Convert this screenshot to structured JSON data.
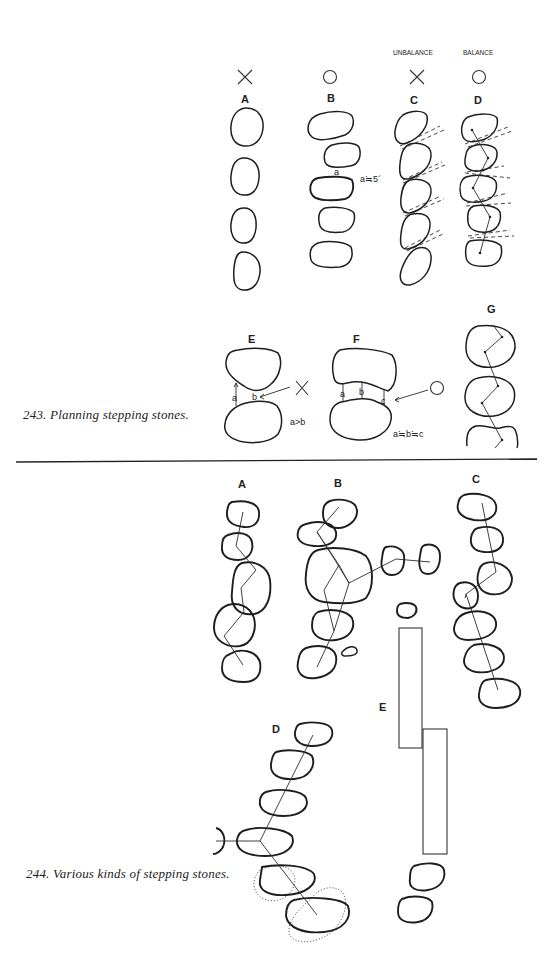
{
  "figure_243": {
    "caption": "243. Planning stepping stones.",
    "header_unbalance": "UNBALANCE",
    "header_balance": "BALANCE",
    "panels": {
      "A": {
        "label": "A",
        "verdict": "×"
      },
      "B": {
        "label": "B",
        "verdict": "○",
        "annotation_a": "a",
        "note": "a≒5´"
      },
      "C": {
        "label": "C",
        "verdict": "×"
      },
      "D": {
        "label": "D",
        "verdict": "○"
      },
      "E": {
        "label": "E",
        "mark_a": "a",
        "mark_b": "b",
        "note": "a>b",
        "verdict": "×"
      },
      "F": {
        "label": "F",
        "mark_a": "a",
        "mark_b": "b",
        "mark_c": "c",
        "note": "a≒b≒c",
        "verdict": "○"
      },
      "G": {
        "label": "G"
      }
    }
  },
  "figure_244": {
    "caption": "244. Various kinds of stepping stones.",
    "panels": {
      "A": {
        "label": "A"
      },
      "B": {
        "label": "B"
      },
      "C": {
        "label": "C"
      },
      "D": {
        "label": "D"
      },
      "E": {
        "label": "E"
      }
    }
  }
}
